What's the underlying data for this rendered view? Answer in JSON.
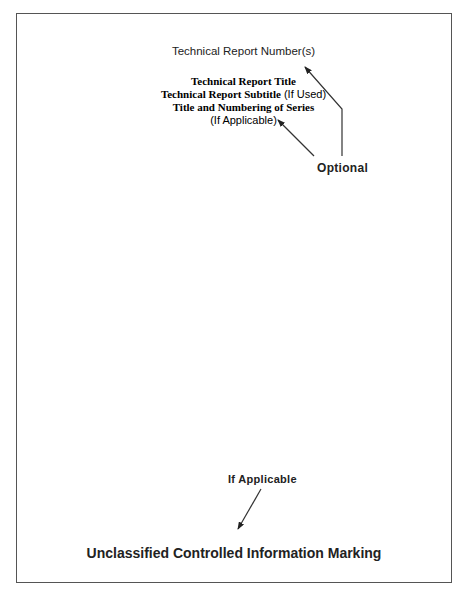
{
  "page": {
    "report_number": "Technical Report Number(s)",
    "title_block": {
      "title": "Technical Report Title",
      "subtitle_bold": "Technical Report Subtitle",
      "subtitle_note": " (If Used)",
      "series": "Title and Numbering of Series",
      "series_note": "(If Applicable)"
    },
    "optional_label": "Optional",
    "if_applicable_label": "If Applicable",
    "marking": "Unclassified Controlled Information Marking"
  }
}
